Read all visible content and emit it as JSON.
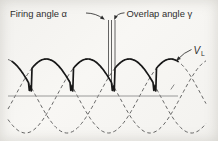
{
  "figure": {
    "labels": {
      "firing_angle": "Firing angle α",
      "overlap_angle": "Overlap angle γ",
      "load_voltage_symbol": "V",
      "load_voltage_subscript": "L"
    },
    "colors": {
      "background": "#f6f5f2",
      "solid_curve": "#181818",
      "dashed_curve": "#4c4c4c",
      "axis": "#8f8f8f",
      "text": "#2f2f2f"
    }
  },
  "chart_data": {
    "type": "line",
    "axis_y": 96,
    "amplitude": 37,
    "period_px": 124.5,
    "phase_peak_x": [
      46.25,
      87.75,
      129.25
    ],
    "crossing_x": [
      25.5,
      67,
      108.5,
      150
    ],
    "alpha_px": 3,
    "gamma_px": 3.5,
    "solid_x_range": [
      12,
      178
    ],
    "dashed_x_range": [
      8,
      206
    ],
    "axis_x_range": [
      8,
      178
    ],
    "marker_lines_x": [
      108.5,
      111.5,
      115
    ],
    "marker_top_y": 20
  }
}
